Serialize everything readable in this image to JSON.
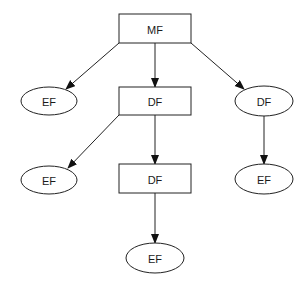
{
  "diagram": {
    "type": "tree",
    "colors": {
      "stroke": "#222222",
      "fill": "#ffffff",
      "text": "#1a1a1a",
      "background": "#ffffff"
    },
    "nodes": [
      {
        "id": "mf",
        "label": "MF",
        "shape": "rectangle",
        "x": 119,
        "y": 14,
        "w": 72,
        "h": 29
      },
      {
        "id": "ef_l1",
        "label": "EF",
        "shape": "ellipse",
        "cx": 49,
        "cy": 101,
        "rx": 28,
        "ry": 14
      },
      {
        "id": "df_mid1",
        "label": "DF",
        "shape": "rectangle",
        "x": 119,
        "y": 87,
        "w": 72,
        "h": 28
      },
      {
        "id": "df_r1",
        "label": "DF",
        "shape": "ellipse",
        "cx": 264,
        "cy": 101,
        "rx": 29,
        "ry": 15
      },
      {
        "id": "ef_l2",
        "label": "EF",
        "shape": "ellipse",
        "cx": 49,
        "cy": 180,
        "rx": 28,
        "ry": 14
      },
      {
        "id": "df_mid2",
        "label": "DF",
        "shape": "rectangle",
        "x": 119,
        "y": 164,
        "w": 72,
        "h": 29
      },
      {
        "id": "ef_r2",
        "label": "EF",
        "shape": "ellipse",
        "cx": 264,
        "cy": 179,
        "rx": 29,
        "ry": 15
      },
      {
        "id": "ef_bot",
        "label": "EF",
        "shape": "ellipse",
        "cx": 155,
        "cy": 258,
        "rx": 29,
        "ry": 15
      }
    ],
    "edges": [
      {
        "from": "mf",
        "to": "ef_l1",
        "x1": 119,
        "y1": 43,
        "x2": 66,
        "y2": 89
      },
      {
        "from": "mf",
        "to": "df_mid1",
        "x1": 155,
        "y1": 43,
        "x2": 155,
        "y2": 87
      },
      {
        "from": "mf",
        "to": "df_r1",
        "x1": 191,
        "y1": 43,
        "x2": 244,
        "y2": 89
      },
      {
        "from": "df_mid1",
        "to": "ef_l2",
        "x1": 119,
        "y1": 115,
        "x2": 68,
        "y2": 168
      },
      {
        "from": "df_mid1",
        "to": "df_mid2",
        "x1": 155,
        "y1": 115,
        "x2": 155,
        "y2": 164
      },
      {
        "from": "df_r1",
        "to": "ef_r2",
        "x1": 264,
        "y1": 116,
        "x2": 264,
        "y2": 164
      },
      {
        "from": "df_mid2",
        "to": "ef_bot",
        "x1": 155,
        "y1": 193,
        "x2": 155,
        "y2": 243
      }
    ]
  }
}
